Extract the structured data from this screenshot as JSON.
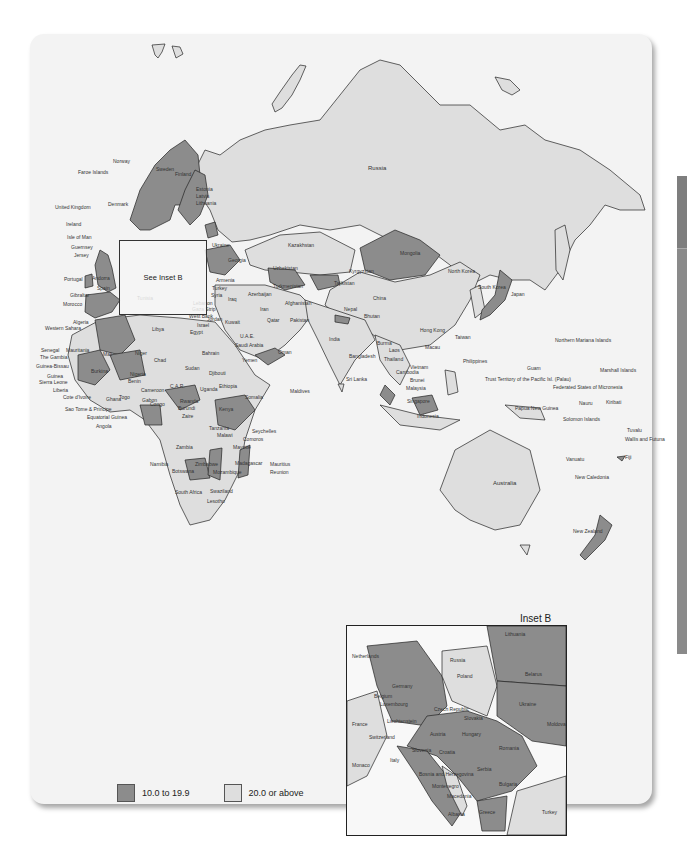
{
  "map": {
    "title": "",
    "colors": {
      "high": "#dedede",
      "low": "#8c8c8c",
      "water": "#f3f3f3",
      "border": "#222222"
    },
    "see_inset_label": "See Inset B",
    "legend": [
      {
        "label": "10.0 to 19.9",
        "color": "#8c8c8c"
      },
      {
        "label": "20.0 or above",
        "color": "#dedede"
      }
    ],
    "inset": {
      "title": "Inset B",
      "labels": [
        "Lithuania",
        "Netherlands",
        "Russia",
        "Belarus",
        "Poland",
        "Germany",
        "Belgium",
        "Luxembourg",
        "Czech Republic",
        "Ukraine",
        "Slovakia",
        "Liechtenstein",
        "France",
        "Moldova",
        "Austria",
        "Hungary",
        "Switzerland",
        "Slovenia",
        "Romania",
        "Croatia",
        "Italy",
        "Monaco",
        "Bosnia and Herzegovina",
        "Serbia",
        "Montenegro",
        "Bulgaria",
        "Macedonia",
        "Albania",
        "Greece",
        "Turkey"
      ]
    },
    "region_labels": {
      "europe": [
        "Norway",
        "Sweden",
        "Finland",
        "Faroe Islands",
        "Estonia",
        "Latvia",
        "Lithuania",
        "United Kingdom",
        "Denmark",
        "Ireland",
        "Isle of Man",
        "Guernsey",
        "Jersey",
        "Portugal",
        "Andorra",
        "Spain",
        "Gibraltar",
        "Ukraine",
        "Georgia",
        "Armenia",
        "Turkey",
        "Russia"
      ],
      "asia": [
        "Kazakhstan",
        "Mongolia",
        "Uzbekistan",
        "Kyrgyzstan",
        "Tajikistan",
        "Turkmenistan",
        "Azerbaijan",
        "Afghanistan",
        "Pakistan",
        "China",
        "North Korea",
        "South Korea",
        "Japan",
        "Nepal",
        "Bhutan",
        "India",
        "Bangladesh",
        "Burma",
        "Laos",
        "Thailand",
        "Cambodia",
        "Vietnam",
        "Hong Kong",
        "Macau",
        "Taiwan",
        "Philippines",
        "Malaysia",
        "Brunei",
        "Singapore",
        "Indonesia",
        "Sri Lanka",
        "Maldives"
      ],
      "middle_east": [
        "Syria",
        "Lebanon",
        "Gaza Strip",
        "West Bank",
        "Israel",
        "Jordan",
        "Iraq",
        "Iran",
        "Kuwait",
        "Qatar",
        "U.A.E.",
        "Saudi Arabia",
        "Bahrain",
        "Oman",
        "Yemen",
        "Cyprus"
      ],
      "africa": [
        "Morocco",
        "Algeria",
        "Tunisia",
        "Libya",
        "Egypt",
        "Western Sahara",
        "Mauritania",
        "Mali",
        "Niger",
        "Chad",
        "Sudan",
        "Senegal",
        "The Gambia",
        "Guinea-Bissau",
        "Guinea",
        "Sierra Leone",
        "Liberia",
        "Cote d'Ivoire",
        "Ghana",
        "Togo",
        "Benin",
        "Burkina",
        "Nigeria",
        "Cameroon",
        "C.A.R.",
        "Sao Tome & Principe",
        "Equatorial Guinea",
        "Gabon",
        "Congo",
        "Angola",
        "Zaire",
        "Rwanda",
        "Burundi",
        "Uganda",
        "Kenya",
        "Ethiopia",
        "Djibouti",
        "Somalia",
        "Tanzania",
        "Malawi",
        "Zambia",
        "Zimbabwe",
        "Mozambique",
        "Namibia",
        "Botswana",
        "South Africa",
        "Swaziland",
        "Lesotho",
        "Madagascar",
        "Comoros",
        "Mayotte",
        "Seychelles",
        "Mauritius",
        "Reunion"
      ],
      "oceania": [
        "Australia",
        "New Zealand",
        "Papua New Guinea",
        "Solomon Islands",
        "Vanuatu",
        "New Caledonia",
        "Fiji",
        "Tuvalu",
        "Wallis and Futuna",
        "Kiribati",
        "Nauru",
        "Marshall Islands",
        "Federated States of Micronesia",
        "Guam",
        "Northern Mariana Islands",
        "Trust Territory of the Pacific Isl. (Palau)"
      ]
    }
  }
}
